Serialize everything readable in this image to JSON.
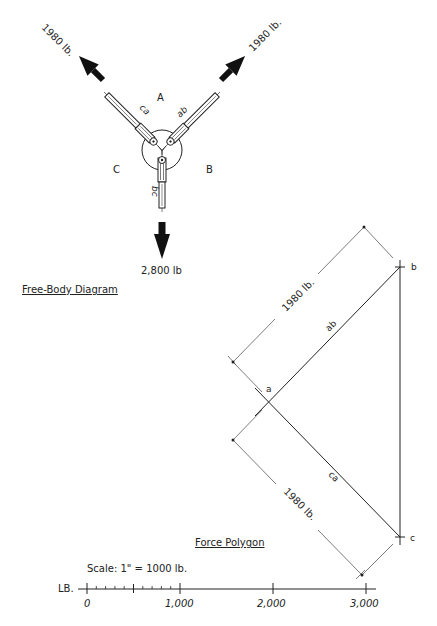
{
  "free_body_diagram": {
    "title": "Free-Body Diagram",
    "regions": {
      "A": "A",
      "B": "B",
      "C": "C"
    },
    "members": {
      "ca": "ca",
      "ab": "ab",
      "bc": "bc"
    },
    "forces": {
      "upper_left": "1980 lb.",
      "upper_right": "1980 lb.",
      "down": "2,800 lb"
    }
  },
  "force_polygon": {
    "title": "Force Polygon",
    "points": {
      "a": "a",
      "b": "b",
      "c": "c"
    },
    "segments": {
      "ab": "ab",
      "ca": "ca"
    },
    "dimensions": {
      "upper": "1980 lb.",
      "lower": "1980 lb."
    }
  },
  "scale": {
    "caption": "Scale: 1\" = 1000 lb.",
    "unit_label": "LB.",
    "ticks": [
      "0",
      "1,000",
      "2,000",
      "3,000"
    ]
  },
  "colors": {
    "ink": "#222222",
    "background": "#ffffff"
  }
}
